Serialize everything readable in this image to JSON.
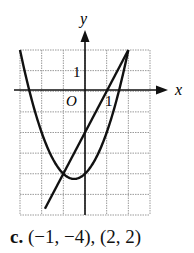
{
  "chart_data": {
    "type": "line",
    "title": "",
    "xlabel": "x",
    "ylabel": "y",
    "xlim": [
      -3,
      3
    ],
    "ylim": [
      -6,
      2
    ],
    "grid": true,
    "tick_labels": {
      "x": [
        "1"
      ],
      "y": [
        "1"
      ],
      "origin": "O"
    },
    "series": [
      {
        "name": "parabola",
        "equation": "y = x^2 + x - 4",
        "x": [
          -3,
          -2,
          -1,
          -0.5,
          0,
          1,
          2
        ],
        "y": [
          2,
          -2,
          -4,
          -4.25,
          -4,
          -2,
          2
        ]
      },
      {
        "name": "line",
        "equation": "y = 2x - 2",
        "x": [
          -1.85,
          2
        ],
        "y": [
          -5.7,
          2
        ]
      }
    ],
    "intersections": [
      [
        -1,
        -4
      ],
      [
        2,
        2
      ]
    ]
  },
  "caption": {
    "label": "c.",
    "text": "(−1, −4), (2, 2)"
  },
  "axes": {
    "x_label": "x",
    "y_label": "y",
    "origin_label": "O",
    "x_tick": "1",
    "y_tick": "1"
  }
}
